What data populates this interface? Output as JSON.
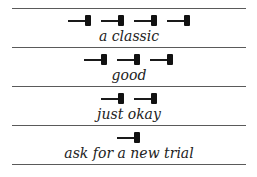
{
  "rating_scale": {
    "rows": [
      {
        "icon": "gavel-icon",
        "count": 4,
        "label": "a classic"
      },
      {
        "icon": "gavel-icon",
        "count": 3,
        "label": "good"
      },
      {
        "icon": "gavel-icon",
        "count": 2,
        "label": "just okay"
      },
      {
        "icon": "gavel-icon",
        "count": 1,
        "label": "ask for a new trial"
      }
    ]
  }
}
